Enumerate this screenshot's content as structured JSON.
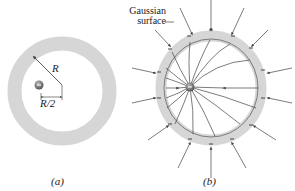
{
  "figure_a": {
    "caption": "(a)",
    "radius_label": "R",
    "offset_label": "R/2",
    "charge_sign": "−"
  },
  "figure_b": {
    "caption": "(b)",
    "gaussian_label_line1": "Gaussian",
    "gaussian_label_line2": "surface",
    "charge_sign": "−"
  },
  "colors": {
    "shell": "#d6d6d6",
    "lines": "#444444",
    "charge": "#777777",
    "text": "#222222"
  }
}
